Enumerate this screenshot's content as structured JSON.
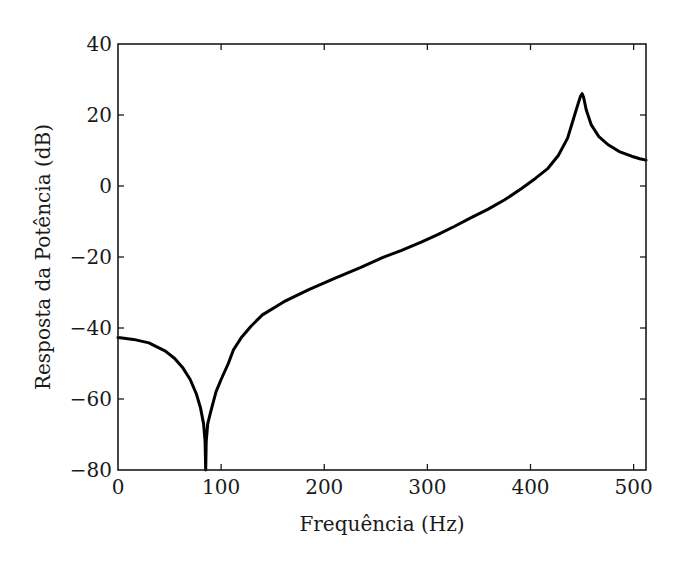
{
  "chart_data": {
    "type": "line",
    "title": "",
    "xlabel": "Frequência (Hz)",
    "ylabel": "Resposta da Potência (dB)",
    "xlim": [
      0,
      512
    ],
    "ylim": [
      -80,
      40
    ],
    "xticks": [
      0,
      100,
      200,
      300,
      400,
      500
    ],
    "xtick_labels": [
      "0",
      "100",
      "200",
      "300",
      "400",
      "500"
    ],
    "yticks": [
      40,
      20,
      0,
      -20,
      -40,
      -60,
      -80
    ],
    "ytick_labels": [
      "40",
      "20",
      "0",
      "−20",
      "−40",
      "−60",
      "−80"
    ],
    "grid": false,
    "legend": null,
    "line_color": "#000000",
    "series": [
      {
        "name": "Resposta da Potência",
        "x": [
          0,
          4,
          15,
          30,
          46,
          55,
          63,
          70,
          76,
          80,
          83,
          84.5,
          85,
          85.5,
          87,
          90,
          95,
          100,
          107,
          112,
          120,
          129,
          140,
          161,
          185,
          210,
          235,
          257,
          275,
          294,
          310,
          326,
          342,
          359,
          375,
          391,
          405,
          417,
          427,
          436,
          442,
          446,
          448.5,
          450,
          451.5,
          454,
          459,
          466,
          475,
          486,
          498,
          506,
          512
        ],
        "y": [
          -42.7,
          -42.8,
          -43.2,
          -44.2,
          -46.5,
          -48.6,
          -51.3,
          -54.5,
          -58.6,
          -62.5,
          -67,
          -72,
          -80,
          -72,
          -67,
          -63.5,
          -58,
          -54.5,
          -50,
          -46.1,
          -42.5,
          -39.5,
          -36.3,
          -32.6,
          -29.2,
          -26,
          -23,
          -20.1,
          -18.1,
          -15.8,
          -13.7,
          -11.4,
          -9,
          -6.5,
          -3.9,
          -0.8,
          2.2,
          5,
          8.6,
          13.5,
          19.2,
          23,
          25.3,
          26,
          25,
          21.5,
          17.2,
          14,
          11.7,
          9.7,
          8.4,
          7.7,
          7.3
        ]
      }
    ]
  }
}
